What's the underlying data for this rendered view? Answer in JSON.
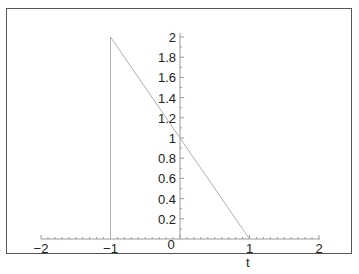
{
  "chart_data": {
    "type": "line",
    "title": "",
    "xlabel": "t",
    "ylabel": "",
    "xlim": [
      -2,
      2
    ],
    "ylim": [
      0,
      2
    ],
    "grid": false,
    "legend": null,
    "x_ticks": [
      "−2",
      "−1",
      "0",
      "1",
      "2"
    ],
    "y_ticks": [
      "0.2",
      "0.4",
      "0.6",
      "0.8",
      "1",
      "1.2",
      "1.4",
      "1.6",
      "1.8",
      "2"
    ],
    "series": [
      {
        "name": "f(t)",
        "x": [
          -1,
          -1,
          1
        ],
        "y": [
          0,
          2,
          0
        ],
        "style": "thin grey line",
        "color": "#b0b0b0"
      }
    ]
  },
  "axes": {
    "x_label": "t",
    "origin_label": "0"
  }
}
